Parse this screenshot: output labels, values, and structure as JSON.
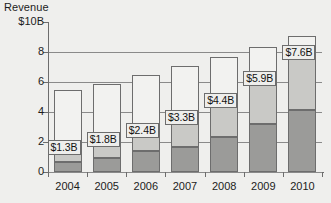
{
  "chart_data": {
    "type": "bar",
    "subtype": "stacked-bar",
    "title": "",
    "ylabel": "Revenue",
    "xlabel": "",
    "ylim": [
      0,
      10
    ],
    "grid": true,
    "legend": "none",
    "categories": [
      "2004",
      "2005",
      "2006",
      "2007",
      "2008",
      "2009",
      "2010"
    ],
    "ytick_labels": [
      "$10B",
      "8",
      "6",
      "4",
      "2",
      "0"
    ],
    "ytick_values": [
      10,
      8,
      6,
      4,
      2,
      0
    ],
    "series": [
      {
        "name": "lower",
        "color": "#9b9b99",
        "values": [
          0.65,
          0.95,
          1.4,
          1.7,
          2.35,
          3.2,
          4.15
        ]
      },
      {
        "name": "middle",
        "color": "#c9c9c6",
        "values": [
          0.65,
          0.85,
          1.0,
          1.6,
          2.05,
          2.7,
          3.45
        ]
      },
      {
        "name": "upper",
        "color": "#f2f2f0",
        "values": [
          4.15,
          4.1,
          4.05,
          3.75,
          3.25,
          2.45,
          1.5
        ]
      }
    ],
    "cumulative_labeled": [
      1.3,
      1.8,
      2.4,
      3.3,
      4.4,
      5.9,
      7.6
    ],
    "totals": [
      5.45,
      5.9,
      6.45,
      7.05,
      7.65,
      8.35,
      9.1
    ],
    "data_labels": [
      "$1.3B",
      "$1.8B",
      "$2.4B",
      "$3.3B",
      "$4.4B",
      "$5.9B",
      "$7.6B"
    ],
    "colors": {
      "axis": "#6d6d6d",
      "gridline": "#8a8a8a",
      "background": "#efefed",
      "text": "#1c1c1c",
      "label_box": "#eeeeec"
    }
  }
}
